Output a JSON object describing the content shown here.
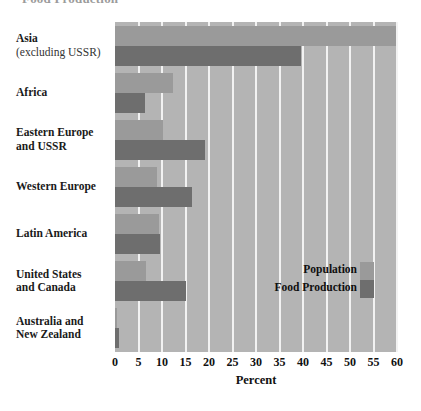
{
  "chart_data": {
    "type": "bar",
    "orientation": "horizontal",
    "title": "Food Production",
    "xlabel": "Percent",
    "ylabel": "",
    "xlim": [
      0,
      60
    ],
    "xticks": [
      0,
      5,
      10,
      15,
      20,
      25,
      30,
      35,
      40,
      45,
      50,
      55,
      60
    ],
    "grid": true,
    "legend_position": "inside-right",
    "categories": [
      "Asia (excluding USSR)",
      "Africa",
      "Eastern Europe and USSR",
      "Western Europe",
      "Latin America",
      "United States and Canada",
      "Australia and New Zealand"
    ],
    "series": [
      {
        "name": "Population",
        "color": "#9a9a9a",
        "values": [
          59.8,
          12.3,
          10.2,
          8.9,
          9.4,
          6.6,
          0.5
        ]
      },
      {
        "name": "Food Production",
        "color": "#6e6e6e",
        "values": [
          39.6,
          6.4,
          19.1,
          16.4,
          9.5,
          15.1,
          0.8
        ]
      }
    ]
  },
  "categories_display": [
    {
      "line1": "Asia",
      "line2": "(excluding USSR)"
    },
    {
      "line1": "Africa",
      "line2": ""
    },
    {
      "line1": "Eastern Europe",
      "line2": "and USSR"
    },
    {
      "line1": "Western Europe",
      "line2": ""
    },
    {
      "line1": "Latin America",
      "line2": ""
    },
    {
      "line1": "United States",
      "line2": "and Canada"
    },
    {
      "line1": "Australia and",
      "line2": "New Zealand"
    }
  ],
  "colors": {
    "plot_background": "#b4b4b4",
    "gridline": "#f2f2f2",
    "population": "#9a9a9a",
    "food_production": "#6e6e6e",
    "text": "#111111"
  }
}
